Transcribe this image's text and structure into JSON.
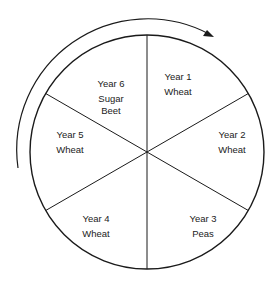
{
  "diagram": {
    "direction": "clockwise",
    "segments": [
      {
        "year": "Year 1",
        "crop": [
          "Wheat"
        ]
      },
      {
        "year": "Year 2",
        "crop": [
          "Wheat"
        ]
      },
      {
        "year": "Year 3",
        "crop": [
          "Peas"
        ]
      },
      {
        "year": "Year 4",
        "crop": [
          "Wheat"
        ]
      },
      {
        "year": "Year 5",
        "crop": [
          "Wheat"
        ]
      },
      {
        "year": "Year 6",
        "crop": [
          "Sugar",
          "Beet"
        ]
      }
    ],
    "colors": {
      "line": "#1a1a1a",
      "text": "#222222",
      "background": "#ffffff"
    }
  }
}
